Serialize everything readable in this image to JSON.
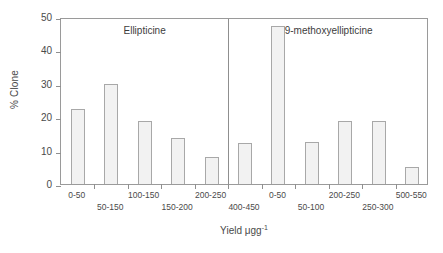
{
  "chart_data": {
    "type": "bar",
    "title": "",
    "xlabel": "Yield μgg",
    "xlabel_superscript": "-1",
    "ylabel": "% Clone",
    "ylim": [
      0,
      50
    ],
    "yticks": [
      0,
      10,
      20,
      30,
      40,
      50
    ],
    "grid": false,
    "legend": "none",
    "panels": [
      {
        "name": "Ellipticine",
        "categories": [
          "0-50",
          "50-150",
          "100-150",
          "150-200",
          "200-250"
        ],
        "values": [
          22.5,
          30.0,
          18.8,
          13.7,
          8.2
        ]
      },
      {
        "name": "9-methoxyellipticine",
        "categories": [
          "400-450",
          "0-50",
          "50-100",
          "200-250",
          "250-300",
          "500-550"
        ],
        "values": [
          12.3,
          47.3,
          12.5,
          18.8,
          18.8,
          5.1
        ]
      }
    ]
  },
  "axis": {
    "y_label": "% Clone",
    "y_tick_labels": [
      "0",
      "10",
      "20",
      "30",
      "40",
      "50"
    ],
    "x_label_text": "Yield μgg",
    "x_label_sup": "-1"
  },
  "panel_titles": {
    "left": "Ellipticine",
    "right": "9-methoxyellipticine"
  },
  "x_tick_labels": [
    "0-50",
    "50-150",
    "100-150",
    "150-200",
    "200-250",
    "400-450",
    "0-50",
    "50-100",
    "200-250",
    "250-300",
    "500-550"
  ],
  "colors": {
    "bar_fill": "#f2f2f2",
    "bar_stroke": "#a8a8a8",
    "axis": "#8f8f8f",
    "text": "#4a4a4a",
    "background": "#ffffff"
  }
}
